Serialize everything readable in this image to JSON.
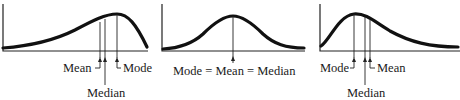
{
  "figure": {
    "panels": [
      {
        "id": "negatively-skewed",
        "labels": {
          "mean": "Mean",
          "median": "Median",
          "mode": "Mode"
        }
      },
      {
        "id": "symmetric",
        "labels": {
          "combined": "Mode = Mean = Median"
        }
      },
      {
        "id": "positively-skewed",
        "labels": {
          "mode": "Mode",
          "median": "Median",
          "mean": "Mean"
        }
      }
    ]
  }
}
